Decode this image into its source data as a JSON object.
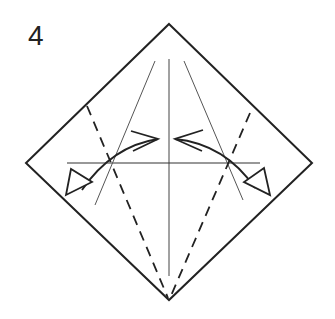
{
  "step": {
    "number": "4"
  },
  "diagram": {
    "colors": {
      "line": "#222222",
      "crease": "#555555",
      "background": "#ffffff"
    },
    "elements": {
      "outline": "diamond-paper",
      "creases": [
        "vertical-center",
        "horizontal-center",
        "left-diagonal-crease",
        "right-diagonal-crease"
      ],
      "valley_folds": [
        "left-valley-fold",
        "right-valley-fold"
      ],
      "arrows": [
        "left-fold-and-unfold-arrow",
        "right-fold-and-unfold-arrow"
      ]
    }
  }
}
